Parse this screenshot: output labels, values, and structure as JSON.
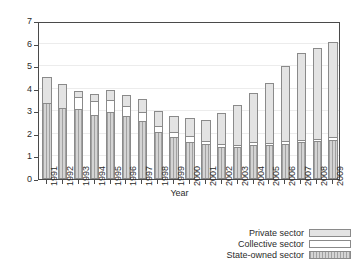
{
  "chart_data": {
    "type": "bar",
    "title": "",
    "subtitle": "",
    "xlabel": "Year",
    "ylabel": "No. of people in million",
    "ylim": [
      0,
      7
    ],
    "yticks": [
      0,
      1,
      2,
      3,
      4,
      5,
      6,
      7
    ],
    "grid": true,
    "stacked": true,
    "legend_position": "bottom-right",
    "categories": [
      "1991",
      "1992",
      "1993",
      "1994",
      "1995",
      "1996",
      "1997",
      "1998",
      "1999",
      "2000",
      "2001",
      "2002",
      "2003",
      "2004",
      "2005",
      "2006",
      "2007",
      "2008",
      "2009"
    ],
    "series": [
      {
        "name": "State-owned sector",
        "color": "#d4d4d4",
        "pattern": "vertical-hatch",
        "values": [
          3.35,
          3.13,
          3.09,
          2.83,
          2.96,
          2.77,
          2.59,
          2.08,
          1.86,
          1.66,
          1.53,
          1.43,
          1.43,
          1.5,
          1.52,
          1.55,
          1.64,
          1.67,
          1.73
        ]
      },
      {
        "name": "Collective sector",
        "color": "#ffffff",
        "pattern": "solid",
        "values": [
          0.0,
          0.0,
          0.61,
          0.66,
          0.59,
          0.53,
          0.41,
          0.32,
          0.27,
          0.27,
          0.21,
          0.18,
          0.14,
          0.18,
          0.11,
          0.17,
          0.12,
          0.13,
          0.18
        ]
      },
      {
        "name": "Private sector",
        "color": "#e3e3e3",
        "pattern": "solid",
        "values": [
          1.22,
          1.13,
          0.3,
          0.38,
          0.49,
          0.5,
          0.62,
          0.7,
          0.75,
          0.85,
          0.96,
          1.39,
          1.79,
          2.24,
          2.72,
          3.38,
          3.91,
          4.1,
          4.26
        ]
      }
    ],
    "totals": [
      4.57,
      4.26,
      4.0,
      3.87,
      4.04,
      3.8,
      3.62,
      3.1,
      2.88,
      2.78,
      2.7,
      3.0,
      3.36,
      3.92,
      4.35,
      5.1,
      5.67,
      5.9,
      6.17
    ]
  },
  "legend": {
    "items": [
      {
        "label": "Private sector"
      },
      {
        "label": "Collective sector"
      },
      {
        "label": "State-owned sector"
      }
    ]
  }
}
